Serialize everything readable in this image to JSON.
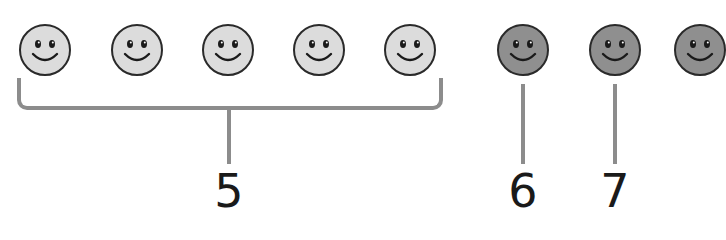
{
  "colors": {
    "light_face": "#dcdcdc",
    "dark_face": "#8f8f8f",
    "outline": "#2a2a2a",
    "connector": "#8c8c8c"
  },
  "faces": [
    {
      "id": 1,
      "shade": "light",
      "cx": 45
    },
    {
      "id": 2,
      "shade": "light",
      "cx": 137
    },
    {
      "id": 3,
      "shade": "light",
      "cx": 228
    },
    {
      "id": 4,
      "shade": "light",
      "cx": 319
    },
    {
      "id": 5,
      "shade": "light",
      "cx": 410
    },
    {
      "id": 6,
      "shade": "dark",
      "cx": 523
    },
    {
      "id": 7,
      "shade": "dark",
      "cx": 615
    },
    {
      "id": 8,
      "shade": "dark",
      "cx": 700,
      "partial": true
    }
  ],
  "labels": {
    "group_count": "5",
    "sixth": "6",
    "seventh": "7"
  }
}
